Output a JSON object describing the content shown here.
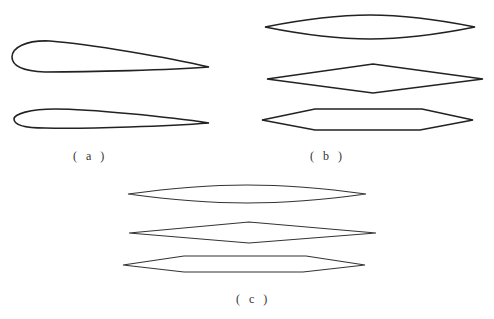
{
  "figure": {
    "panels": [
      {
        "id": "a",
        "label": "( a )",
        "shapes": [
          "thick-airfoil",
          "thin-airfoil"
        ]
      },
      {
        "id": "b",
        "label": "( b )",
        "shapes": [
          "biconvex-lens",
          "double-wedge-diamond",
          "hexagonal"
        ]
      },
      {
        "id": "c",
        "label": "( c )",
        "shapes": [
          "biconvex-lens",
          "double-wedge-diamond",
          "hexagonal"
        ]
      }
    ],
    "stroke_color": "#222222",
    "background": "#ffffff"
  }
}
